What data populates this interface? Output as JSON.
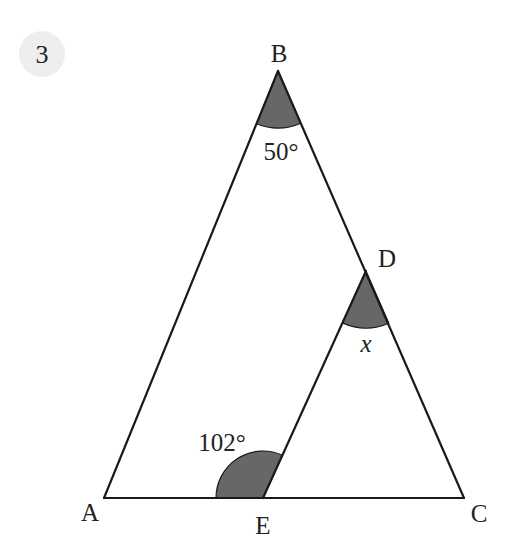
{
  "question": {
    "number": "3",
    "badge_color": "#eeeeee"
  },
  "points": {
    "A": {
      "label": "A",
      "x": 104,
      "y": 498
    },
    "B": {
      "label": "B",
      "x": 278,
      "y": 71
    },
    "C": {
      "label": "C",
      "x": 464,
      "y": 498
    },
    "D": {
      "label": "D",
      "x": 366,
      "y": 271
    },
    "E": {
      "label": "E",
      "x": 263,
      "y": 498
    }
  },
  "angles": {
    "B": {
      "label": "50°",
      "shaded": true
    },
    "D": {
      "label": "x",
      "shaded": true
    },
    "E": {
      "label": "102°",
      "shaded": true
    }
  },
  "colors": {
    "line": "#1a1a1a",
    "shade": "#676767",
    "text": "#222222"
  }
}
